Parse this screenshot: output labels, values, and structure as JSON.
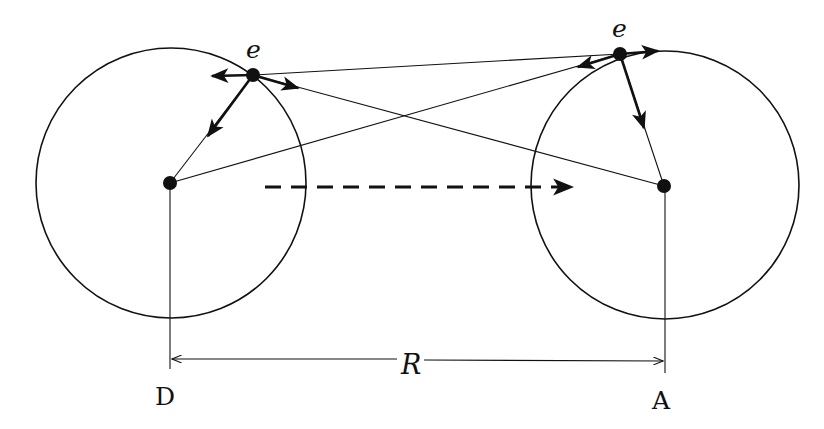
{
  "diagram": {
    "labels": {
      "electron_left": "e",
      "electron_right": "e",
      "distance": "R",
      "nucleus_left": "D",
      "nucleus_right": "A"
    },
    "colors": {
      "ink": "#111111",
      "background": "#ffffff"
    },
    "atoms": [
      {
        "name": "D",
        "nucleus": [
          170,
          183
        ],
        "circle_center": [
          171,
          183
        ],
        "radius": 135,
        "electron": [
          253,
          75
        ]
      },
      {
        "name": "A",
        "nucleus": [
          664,
          186
        ],
        "circle_center": [
          665,
          185
        ],
        "radius": 134,
        "electron": [
          620,
          54
        ]
      }
    ]
  }
}
